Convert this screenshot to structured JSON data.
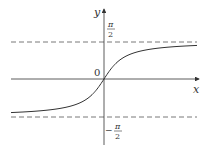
{
  "chart_data": {
    "type": "line",
    "title": "",
    "function": "y = arctan(x)",
    "xlabel": "x",
    "ylabel": "y",
    "origin_label": "0",
    "asymptotes": [
      {
        "label": "π/2",
        "y": 1.5708,
        "style": "dashed"
      },
      {
        "label": "-π/2",
        "y": -1.5708,
        "style": "dashed"
      }
    ],
    "x_range": [
      -6,
      6
    ],
    "ylim": [
      -2.2,
      2.2
    ],
    "grid": false,
    "legend": null,
    "x": [
      -6,
      -4,
      -3,
      -2,
      -1,
      -0.5,
      0,
      0.5,
      1,
      2,
      3,
      4,
      6
    ],
    "values": [
      -1.406,
      -1.326,
      -1.249,
      -1.107,
      -0.785,
      -0.464,
      0,
      0.464,
      0.785,
      1.107,
      1.249,
      1.326,
      1.406
    ]
  },
  "labels": {
    "x_axis": "x",
    "y_axis": "y",
    "origin": "0",
    "pi": "π",
    "two": "2",
    "minus": "−"
  }
}
